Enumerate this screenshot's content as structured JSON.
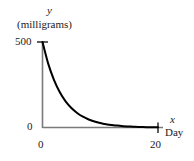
{
  "chart_data": {
    "type": "line",
    "title": "",
    "subtitle": "",
    "xlabel": "Day",
    "ylabel": "(milligrams)",
    "x_axis_symbol": "x",
    "y_axis_symbol": "y",
    "xlim": [
      0,
      20
    ],
    "ylim": [
      0,
      500
    ],
    "x_ticks": [
      0,
      20
    ],
    "x_tick_labels": [
      "0",
      "20"
    ],
    "y_ticks": [
      0,
      500
    ],
    "y_tick_labels": [
      "0",
      "500"
    ],
    "grid": false,
    "legend": null,
    "annotations": [],
    "series": [
      {
        "name": "drug amount remaining",
        "description": "exponential decay from 500 mg at day 0 toward 0 mg at day 20",
        "x": [
          0,
          1,
          2,
          3,
          4,
          5,
          6,
          7,
          8,
          9,
          10,
          11,
          12,
          13,
          14,
          15,
          16,
          17,
          18,
          19,
          20
        ],
        "y": [
          500,
          372,
          277,
          206,
          153,
          114,
          85,
          63,
          47,
          35,
          26,
          19,
          14,
          11,
          8,
          6,
          4,
          3,
          2,
          2,
          1
        ],
        "color": "#000000",
        "linewidth": 2
      }
    ],
    "axis_color": "#6b6b6b",
    "curve_color": "#000000"
  },
  "labels": {
    "y_symbol": "y",
    "y_unit": "(milligrams)",
    "y_tick_top": "500",
    "y_tick_bottom": "0",
    "x_tick_left": "0",
    "x_tick_right": "20",
    "x_symbol": "x",
    "x_unit": "Day"
  }
}
